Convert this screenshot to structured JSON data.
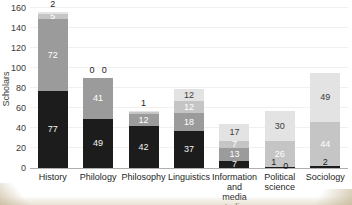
{
  "figure": {
    "background": "#ffffff",
    "page_edge_tint": "#cbbc9e"
  },
  "chart_data": {
    "type": "bar",
    "stacked": true,
    "title": "",
    "xlabel": "",
    "ylabel": "Scholars",
    "ylim": [
      0,
      160
    ],
    "yticks": [
      0,
      20,
      40,
      60,
      80,
      100,
      120,
      140,
      160
    ],
    "grid": "horizontal-faint",
    "legend": "none",
    "categories": [
      "History",
      "Philology",
      "Philosophy",
      "Linguistics",
      "Information and media studies",
      "Political science",
      "Sociology"
    ],
    "category_label_lines": [
      [
        "History"
      ],
      [
        "Philology"
      ],
      [
        "Philosophy"
      ],
      [
        "Linguistics"
      ],
      [
        "Information and",
        "media studies"
      ],
      [
        "Political",
        "science"
      ],
      [
        "Sociology"
      ]
    ],
    "series": [
      {
        "name": "segment-black",
        "color": "#1c1c1c",
        "label_color": "#f2f2f2",
        "values": [
          77,
          49,
          42,
          37,
          7,
          1,
          2
        ]
      },
      {
        "name": "segment-dark-gray",
        "color": "#9b9b9b",
        "label_color": "#ffffff",
        "values": [
          72,
          41,
          12,
          18,
          13,
          0,
          0
        ]
      },
      {
        "name": "segment-light-gray",
        "color": "#c5c5c5",
        "label_color": "#ffffff",
        "values": [
          5,
          0,
          2,
          12,
          7,
          26,
          44
        ]
      },
      {
        "name": "segment-pale-gray",
        "color": "#e3e3e3",
        "label_color": "#3c3c3c",
        "values": [
          2,
          0,
          1,
          12,
          17,
          30,
          49
        ]
      }
    ],
    "totals": [
      156,
      90,
      57,
      79,
      44,
      57,
      95
    ],
    "outside_labels_above": [
      [
        "2"
      ],
      [
        "0",
        "0"
      ],
      [
        "1"
      ],
      [],
      [],
      [],
      []
    ],
    "outside_labels_below": [
      [],
      [],
      [],
      [],
      [],
      [
        "1",
        "0"
      ],
      [
        "2"
      ]
    ],
    "inside_label_min_value": 5
  }
}
